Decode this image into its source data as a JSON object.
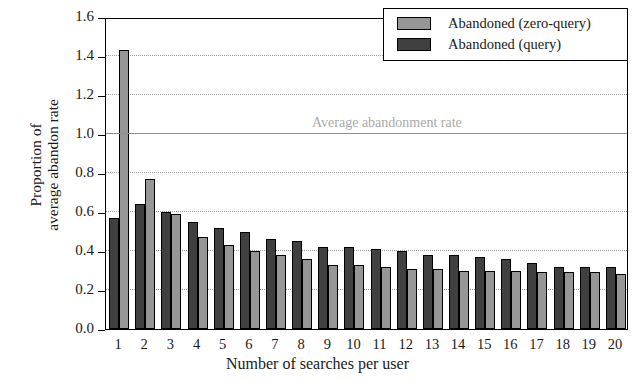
{
  "chart_data": {
    "type": "bar",
    "title": "",
    "xlabel": "Number of searches per user",
    "ylabel": "Proportion of\naverage abandon rate",
    "ylim": [
      0.0,
      1.6
    ],
    "ytick_labels": [
      "0.0",
      "0.2",
      "0.4",
      "0.6",
      "0.8",
      "1.0",
      "1.2",
      "1.4",
      "1.6"
    ],
    "ytick_values": [
      0.0,
      0.2,
      0.4,
      0.6,
      0.8,
      1.0,
      1.2,
      1.4,
      1.6
    ],
    "grid": "horizontal-dotted",
    "legend_position": "top-right",
    "categories": [
      "1",
      "2",
      "3",
      "4",
      "5",
      "6",
      "7",
      "8",
      "9",
      "10",
      "11",
      "12",
      "13",
      "14",
      "15",
      "16",
      "17",
      "18",
      "19",
      "20"
    ],
    "series": [
      {
        "name": "Abandoned (query)",
        "color": "#404040",
        "values": [
          0.57,
          0.64,
          0.6,
          0.55,
          0.52,
          0.5,
          0.46,
          0.45,
          0.42,
          0.42,
          0.41,
          0.4,
          0.38,
          0.38,
          0.37,
          0.36,
          0.34,
          0.32,
          0.32,
          0.32
        ]
      },
      {
        "name": "Abandoned (zero-query)",
        "color": "#969696",
        "values": [
          1.43,
          0.77,
          0.59,
          0.47,
          0.43,
          0.4,
          0.38,
          0.36,
          0.33,
          0.33,
          0.32,
          0.31,
          0.31,
          0.3,
          0.3,
          0.3,
          0.29,
          0.29,
          0.29,
          0.28
        ]
      }
    ],
    "annotations": [
      {
        "text": "Average abandonment rate",
        "y": 1.0,
        "line": true,
        "line_color": "#8f8f8f",
        "text_color": "#a9a9a9"
      }
    ]
  },
  "legend": {
    "entries": [
      {
        "label": "Abandoned (zero-query)",
        "swatch": "light"
      },
      {
        "label": "Abandoned (query)",
        "swatch": "dark"
      }
    ]
  }
}
